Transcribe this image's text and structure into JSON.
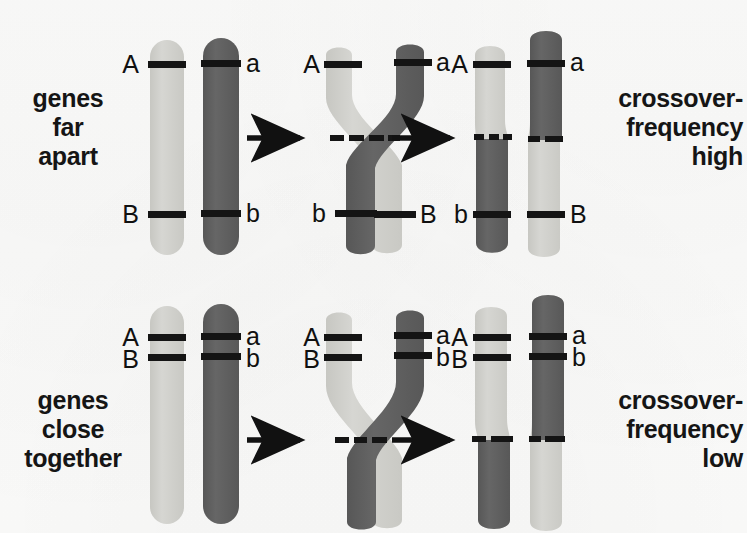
{
  "colors": {
    "light_chromatid": "#cfcfcb",
    "dark_chromatid": "#5d5d5d",
    "band": "#141414",
    "text": "#151515",
    "background": "#fbfbfa"
  },
  "rows": [
    {
      "id": "genes-far-apart",
      "left_caption": "genes\nfar\napart",
      "right_caption": "crossover-\nfrequency\nhigh",
      "stage1": {
        "name": "homologous-pair-before-crossover",
        "labels": [
          {
            "text": "A",
            "side": "left",
            "gene": "A",
            "chromatid": "light"
          },
          {
            "text": "a",
            "side": "right",
            "gene": "A",
            "chromatid": "dark"
          },
          {
            "text": "B",
            "side": "left",
            "gene": "B",
            "chromatid": "light"
          },
          {
            "text": "b",
            "side": "right",
            "gene": "B",
            "chromatid": "dark"
          }
        ]
      },
      "stage2": {
        "name": "chiasma-crossing-over",
        "labels": [
          {
            "text": "A",
            "side": "left",
            "gene": "A",
            "chromatid": "light"
          },
          {
            "text": "a",
            "side": "right",
            "gene": "A",
            "chromatid": "dark"
          },
          {
            "text": "b",
            "side": "left",
            "gene": "B",
            "chromatid": "dark"
          },
          {
            "text": "B",
            "side": "right",
            "gene": "B",
            "chromatid": "light"
          }
        ]
      },
      "stage3": {
        "name": "recombinant-chromatids",
        "labels": [
          {
            "text": "A",
            "side": "left",
            "gene": "A",
            "chromatid": "light"
          },
          {
            "text": "a",
            "side": "right",
            "gene": "A",
            "chromatid": "dark"
          },
          {
            "text": "b",
            "side": "left",
            "gene": "B",
            "chromatid": "dark"
          },
          {
            "text": "B",
            "side": "right",
            "gene": "B",
            "chromatid": "light"
          }
        ],
        "outcome": "recombinant"
      },
      "arrows": 2
    },
    {
      "id": "genes-close-together",
      "left_caption": "genes\nclose\ntogether",
      "right_caption": "crossover-\nfrequency\nlow",
      "stage1": {
        "name": "homologous-pair-before-crossover",
        "labels": [
          {
            "text": "A",
            "side": "left",
            "gene": "A",
            "chromatid": "light"
          },
          {
            "text": "a",
            "side": "right",
            "gene": "A",
            "chromatid": "dark"
          },
          {
            "text": "B",
            "side": "left",
            "gene": "B",
            "chromatid": "light"
          },
          {
            "text": "b",
            "side": "right",
            "gene": "B",
            "chromatid": "dark"
          }
        ]
      },
      "stage2": {
        "name": "chiasma-crossing-over",
        "labels": [
          {
            "text": "A",
            "side": "left",
            "gene": "A",
            "chromatid": "light"
          },
          {
            "text": "a",
            "side": "right",
            "gene": "A",
            "chromatid": "dark"
          },
          {
            "text": "B",
            "side": "left",
            "gene": "B",
            "chromatid": "light"
          },
          {
            "text": "b",
            "side": "right",
            "gene": "B",
            "chromatid": "dark"
          }
        ]
      },
      "stage3": {
        "name": "parental-chromatids",
        "labels": [
          {
            "text": "A",
            "side": "left",
            "gene": "A",
            "chromatid": "light"
          },
          {
            "text": "a",
            "side": "right",
            "gene": "A",
            "chromatid": "dark"
          },
          {
            "text": "B",
            "side": "left",
            "gene": "B",
            "chromatid": "light"
          },
          {
            "text": "b",
            "side": "right",
            "gene": "B",
            "chromatid": "dark"
          }
        ],
        "outcome": "parental"
      },
      "arrows": 2
    }
  ],
  "labels": {
    "row1": {
      "s1_A": "A",
      "s1_a": "a",
      "s1_B": "B",
      "s1_b": "b",
      "s2_A": "A",
      "s2_a": "a",
      "s2_b": "b",
      "s2_B": "B",
      "s3_A": "A",
      "s3_a": "a",
      "s3_b": "b",
      "s3_B": "B"
    },
    "row2": {
      "s1_A": "A",
      "s1_a": "a",
      "s1_B": "B",
      "s1_b": "b",
      "s2_A": "A",
      "s2_a": "a",
      "s2_B": "B",
      "s2_b": "b",
      "s3_A": "A",
      "s3_a": "a",
      "s3_B": "B",
      "s3_b": "b"
    }
  },
  "captions": {
    "top_left": "genes\nfar\napart",
    "top_right": "crossover-\nfrequency\nhigh",
    "bottom_left": "genes\nclose\ntogether",
    "bottom_right": "crossover-\nfrequency\nlow"
  }
}
